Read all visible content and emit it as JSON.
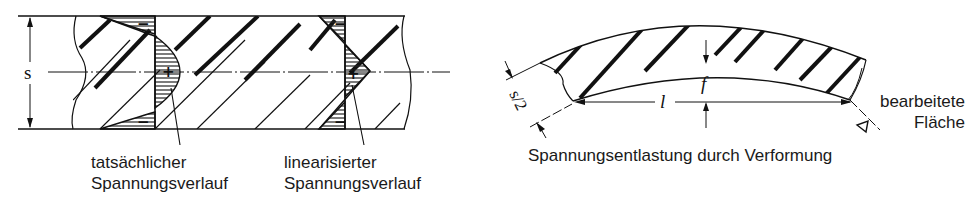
{
  "left_figure": {
    "dimension_label": "s",
    "labels": {
      "actual": {
        "line1": "tatsächlicher",
        "line2": "Spannungsverlauf"
      },
      "linearized": {
        "line1": "linearisierter",
        "line2": "Spannungsverlauf"
      }
    },
    "stress_signs": {
      "tension": "+",
      "compression": "−"
    }
  },
  "right_figure": {
    "caption": "Spannungsentlastung durch Verformung",
    "dimension_half_thickness": "s/2",
    "dimension_length": "l",
    "dimension_deflection": "f",
    "surface_label": {
      "line1": "bearbeitete",
      "line2": "Fläche"
    }
  }
}
